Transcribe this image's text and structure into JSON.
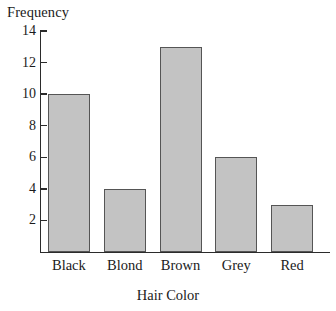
{
  "chart_data": {
    "type": "bar",
    "title": "",
    "subtitle": "",
    "categories": [
      "Black",
      "Blond",
      "Brown",
      "Grey",
      "Red"
    ],
    "values": [
      10,
      4,
      13,
      6,
      3
    ],
    "xlabel": "Hair Color",
    "ylabel": "Frequency",
    "ylim": [
      0,
      14
    ],
    "ytick_labels": [
      "2",
      "4",
      "6",
      "8",
      "10",
      "12",
      "14"
    ],
    "ytick_values": [
      2,
      4,
      6,
      8,
      10,
      12,
      14
    ],
    "grid": false,
    "legend": null,
    "series": [
      {
        "name": "Frequency",
        "values": [
          10,
          4,
          13,
          6,
          3
        ]
      }
    ],
    "bar_fill_color": "#c3c3c3",
    "bar_border_color": "#555555",
    "axis_color": "#2b2b2b",
    "background_color": "#ffffff"
  }
}
